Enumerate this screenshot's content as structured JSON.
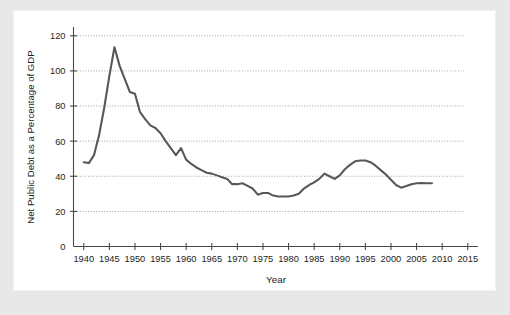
{
  "chart_data": {
    "type": "line",
    "title": "",
    "xlabel": "Year",
    "ylabel": "Net Public Debt as a Percentage of GDP",
    "xlim": [
      1938,
      2017
    ],
    "ylim": [
      0,
      125
    ],
    "xticks": [
      1940,
      1945,
      1950,
      1955,
      1960,
      1965,
      1970,
      1975,
      1980,
      1985,
      1990,
      1995,
      2000,
      2005,
      2010,
      2015
    ],
    "xtick_labels": [
      "1940",
      "1945",
      "1950",
      "1955",
      "1960",
      "1965",
      "1970",
      "1975",
      "1980",
      "1985",
      "1990",
      "1995",
      "2000",
      "2005",
      "2010",
      "2015"
    ],
    "yticks": [
      0,
      20,
      40,
      60,
      80,
      100,
      120
    ],
    "ytick_labels": [
      "0",
      "20",
      "40",
      "60",
      "80",
      "100",
      "120"
    ],
    "grid": "horizontal-dotted",
    "legend": "none",
    "series": [
      {
        "name": "Net Public Debt as a Percentage of GDP",
        "color": "#585858",
        "x": [
          1940,
          1941,
          1942,
          1943,
          1944,
          1945,
          1946,
          1947,
          1948,
          1949,
          1950,
          1951,
          1952,
          1953,
          1954,
          1955,
          1956,
          1957,
          1958,
          1959,
          1960,
          1961,
          1962,
          1963,
          1964,
          1965,
          1966,
          1967,
          1968,
          1969,
          1970,
          1971,
          1972,
          1973,
          1974,
          1975,
          1976,
          1977,
          1978,
          1979,
          1980,
          1981,
          1982,
          1983,
          1984,
          1985,
          1986,
          1987,
          1988,
          1989,
          1990,
          1991,
          1992,
          1993,
          1994,
          1995,
          1996,
          1997,
          1998,
          1999,
          2000,
          2001,
          2002,
          2003,
          2004,
          2005,
          2006,
          2007,
          2008
        ],
        "y": [
          48,
          47.5,
          52,
          63.5,
          79,
          97,
          113.5,
          103,
          95.5,
          88,
          87,
          76.5,
          72.5,
          69,
          67.5,
          64.5,
          60,
          56,
          52,
          56,
          49.5,
          47,
          45,
          43.5,
          42,
          41.5,
          40.5,
          39.5,
          38.5,
          35.5,
          35.5,
          36,
          34.5,
          33,
          29.5,
          30.5,
          30.5,
          29,
          28.5,
          28.5,
          28.5,
          29,
          30,
          33,
          35,
          36.5,
          38.5,
          41.5,
          40,
          38.5,
          40.5,
          44,
          46.5,
          48.5,
          49,
          49,
          48,
          46,
          43.5,
          41,
          38,
          35,
          33.5,
          34.5,
          35.5,
          36,
          36.2,
          36,
          36
        ]
      }
    ]
  },
  "figure": {
    "background": "#ffffff",
    "page_background": "#e8e8e8",
    "line_color": "#585858",
    "axis_color": "#4a4a4a",
    "grid_color": "#9a9a9a",
    "text_color": "#1d1d1d"
  }
}
